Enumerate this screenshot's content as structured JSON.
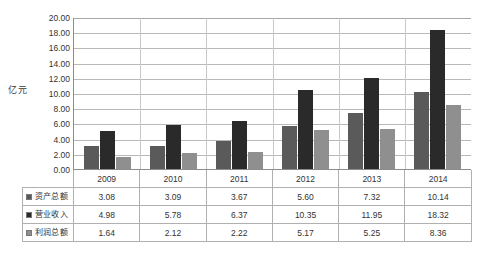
{
  "chart_data": {
    "type": "bar",
    "title": "",
    "subtitle": "",
    "xlabel": "",
    "ylabel": "亿元",
    "ylim": [
      0,
      20
    ],
    "ytick_step": 2,
    "yticks": [
      "20.00",
      "18.00",
      "16.00",
      "14.00",
      "12.00",
      "10.00",
      "8.00",
      "6.00",
      "4.00",
      "2.00",
      "0.00"
    ],
    "grid": true,
    "legend_position": "table-left",
    "categories": [
      "2009",
      "2010",
      "2011",
      "2012",
      "2013",
      "2014"
    ],
    "series": [
      {
        "name": "资产总额",
        "color": "#5a5a5a",
        "values": [
          3.08,
          3.09,
          3.67,
          5.6,
          7.32,
          10.14
        ],
        "labels": [
          "3.08",
          "3.09",
          "3.67",
          "5.60",
          "7.32",
          "10.14"
        ]
      },
      {
        "name": "营业收入",
        "color": "#2a2a2a",
        "values": [
          4.98,
          5.78,
          6.37,
          10.35,
          11.95,
          18.32
        ],
        "labels": [
          "4.98",
          "5.78",
          "6.37",
          "10.35",
          "11.95",
          "18.32"
        ]
      },
      {
        "name": "利润总额",
        "color": "#8f8f8f",
        "values": [
          1.64,
          2.12,
          2.22,
          5.17,
          5.25,
          8.36
        ],
        "labels": [
          "1.64",
          "2.12",
          "2.22",
          "5.17",
          "5.25",
          "8.36"
        ]
      }
    ]
  },
  "colors": {
    "series_1": "#5a5a5a",
    "series_2": "#2a2a2a",
    "series_3": "#8f8f8f",
    "gridline": "#b9b9b9",
    "axis": "#8c8c8c",
    "table_border": "#b0b0b0",
    "background": "#ffffff"
  }
}
